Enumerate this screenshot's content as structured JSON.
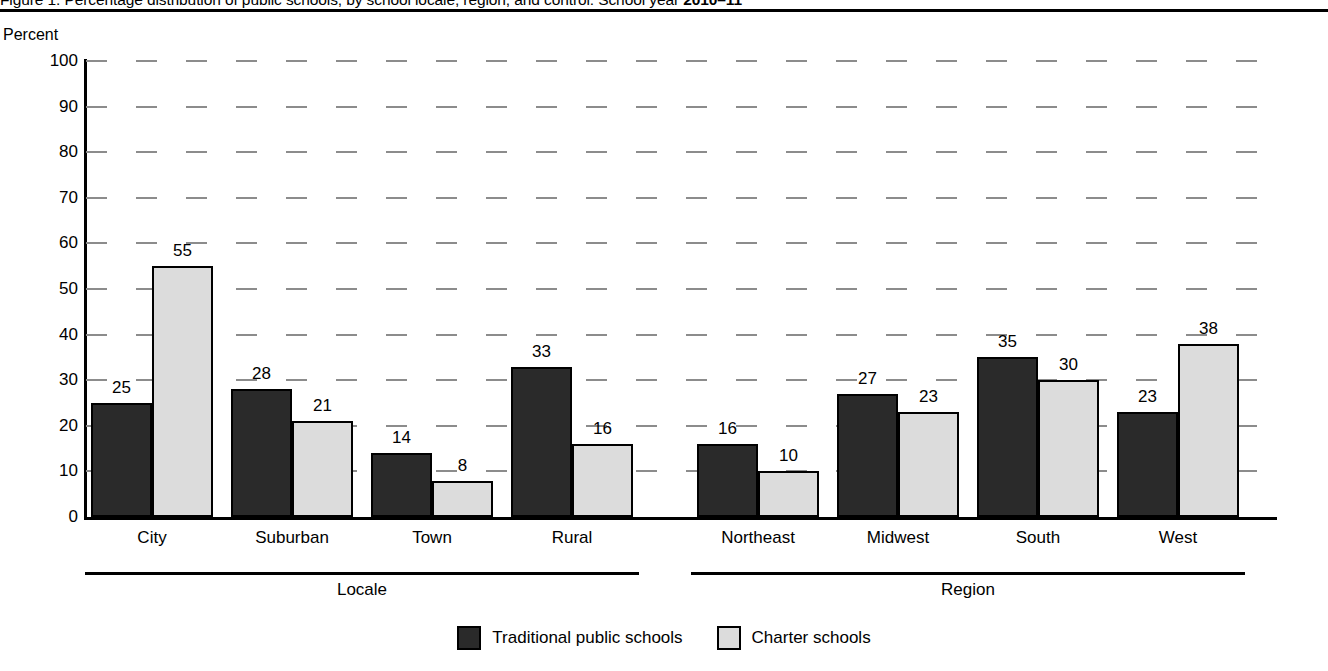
{
  "figure": {
    "title_prefix": "Figure 1. Percentage distribution of public schools, by school locale, region, and control: School year ",
    "title_year": "2010–11",
    "full_title": "Figure 1. Percentage distribution of public schools, by school locale, region, and control: School year 2010–11"
  },
  "axis": {
    "y_title": "Percent"
  },
  "groups": [
    {
      "label": "Locale"
    },
    {
      "label": "Region"
    }
  ],
  "legend": {
    "items": [
      {
        "label": "Traditional public schools",
        "color": "#2a2a2a",
        "swatch": "dark-square-swatch"
      },
      {
        "label": "Charter schools",
        "color": "#dcdcdc",
        "swatch": "light-square-swatch"
      }
    ]
  },
  "chart_data": {
    "type": "bar",
    "title": "Figure 1. Percentage distribution of public schools, by school locale, region, and control: School year 2010–11",
    "xlabel": "",
    "ylabel": "Percent",
    "ylim": [
      0,
      100
    ],
    "yticks": [
      0,
      10,
      20,
      30,
      40,
      50,
      60,
      70,
      80,
      90,
      100
    ],
    "ytick_labels": [
      "0",
      "10",
      "20",
      "30",
      "40",
      "50",
      "60",
      "70",
      "80",
      "90",
      "100"
    ],
    "grid": true,
    "grid_axis": "y",
    "grid_style": "dashed",
    "legend_position": "bottom-center",
    "categories": [
      "City",
      "Suburban",
      "Town",
      "Rural",
      "Northeast",
      "Midwest",
      "South",
      "West"
    ],
    "category_groups": [
      {
        "label": "Locale",
        "categories": [
          "City",
          "Suburban",
          "Town",
          "Rural"
        ]
      },
      {
        "label": "Region",
        "categories": [
          "Northeast",
          "Midwest",
          "South",
          "West"
        ]
      }
    ],
    "series": [
      {
        "name": "Traditional public schools",
        "color": "#2a2a2a",
        "values": [
          25,
          28,
          14,
          33,
          16,
          27,
          35,
          23
        ]
      },
      {
        "name": "Charter schools",
        "color": "#dcdcdc",
        "values": [
          55,
          21,
          8,
          16,
          10,
          23,
          30,
          38
        ]
      }
    ]
  }
}
